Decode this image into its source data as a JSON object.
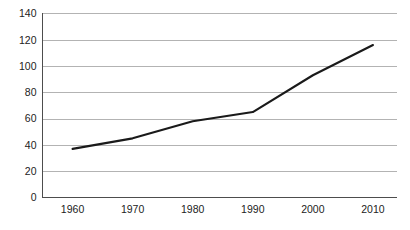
{
  "chart_data": {
    "type": "line",
    "title": "",
    "subtitle": "",
    "xlabel": "",
    "ylabel": "",
    "x": [
      1960,
      1970,
      1980,
      1990,
      2000,
      2010
    ],
    "categories": [
      "1960",
      "1970",
      "1980",
      "1990",
      "2000",
      "2010"
    ],
    "values": [
      37,
      45,
      58,
      65,
      93,
      116
    ],
    "series": [
      {
        "name": "",
        "values": [
          37,
          45,
          58,
          65,
          93,
          116
        ]
      }
    ],
    "xlim": [
      1955,
      2014
    ],
    "ylim": [
      0,
      140
    ],
    "ytick_labels": [
      "0",
      "20",
      "40",
      "60",
      "80",
      "100",
      "120",
      "140"
    ],
    "ytick_values": [
      0,
      20,
      40,
      60,
      80,
      100,
      120,
      140
    ],
    "xtick_labels": [
      "1960",
      "1970",
      "1980",
      "1990",
      "2000",
      "2010"
    ],
    "grid": "horizontal",
    "legend": "none",
    "line_color": "#1a1a1a",
    "grid_color": "#b3b3b3",
    "axis_color": "#4d4d4d",
    "background_color": "#ffffff"
  }
}
